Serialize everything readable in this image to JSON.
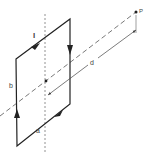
{
  "diagram": {
    "labels": {
      "current": "I",
      "side_vertical": "b",
      "side_horizontal": "a",
      "distance": "d",
      "point": "P"
    },
    "colors": {
      "line": "#222222",
      "dashed": "#555555",
      "text": "#444444"
    }
  }
}
